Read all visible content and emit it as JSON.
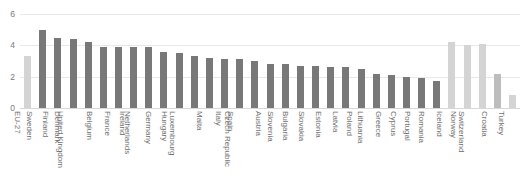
{
  "chart_data": {
    "type": "bar",
    "title": "",
    "xlabel": "",
    "ylabel": "",
    "ylim": [
      0,
      6
    ],
    "yticks": [
      0,
      2,
      4,
      6
    ],
    "ytick_labels": [
      "0",
      "2",
      "4",
      "6"
    ],
    "grid": true,
    "legend": "none",
    "categories": [
      "EU-27",
      "Sweden",
      "Finland",
      "Denmark",
      "United Kingdom",
      "Belgium",
      "France",
      "Ireland",
      "Netherlands",
      "Germany",
      "Hungary",
      "Luxembourg",
      "Malta",
      "Italy",
      "Spain",
      "Czech Republic",
      "Austria",
      "Slovenia",
      "Bulgaria",
      "Slovakia",
      "Estonia",
      "Latvia",
      "Poland",
      "Lithuania",
      "Greece",
      "Cyprus",
      "Portugal",
      "Romania",
      "Iceland",
      "Norway",
      "Switzerland",
      "Croatia",
      "Turkey"
    ],
    "values": [
      3.3,
      5.0,
      4.5,
      4.4,
      4.2,
      3.9,
      3.9,
      3.9,
      3.9,
      3.6,
      3.5,
      3.3,
      3.2,
      3.1,
      3.1,
      3.0,
      2.8,
      2.8,
      2.7,
      2.7,
      2.6,
      2.6,
      2.5,
      2.2,
      2.1,
      2.0,
      1.9,
      1.7,
      4.2,
      4.0,
      4.1,
      2.2,
      0.85
    ],
    "bar_styles": [
      "light",
      "dark",
      "dark",
      "dark",
      "dark",
      "dark",
      "dark",
      "dark",
      "dark",
      "dark",
      "dark",
      "dark",
      "dark",
      "dark",
      "dark",
      "dark",
      "dark",
      "dark",
      "dark",
      "dark",
      "dark",
      "dark",
      "dark",
      "dark",
      "dark",
      "dark",
      "dark",
      "dark",
      "light",
      "light",
      "light",
      "mid",
      "light"
    ],
    "colors": {
      "bar_dark": "#787878",
      "bar_light": "#d4d4d4",
      "bar_mid": "#bdbdbd",
      "gridline": "#e8e8e8",
      "axis": "#d8d8d8",
      "tick_text": "#7a7a7a",
      "label_text": "#6e6e6e",
      "background": "#ffffff"
    }
  }
}
